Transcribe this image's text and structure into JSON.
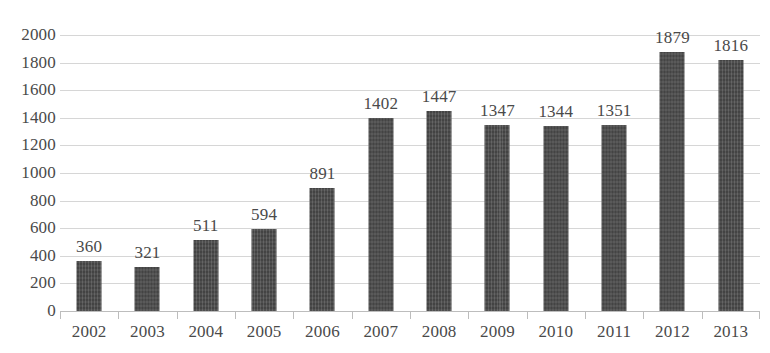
{
  "chart_data": {
    "type": "bar",
    "title": "",
    "subtitle": "",
    "xlabel": "",
    "ylabel": "",
    "categories": [
      "2002",
      "2003",
      "2004",
      "2005",
      "2006",
      "2007",
      "2008",
      "2009",
      "2010",
      "2011",
      "2012",
      "2013"
    ],
    "values": [
      360,
      321,
      511,
      594,
      891,
      1402,
      1447,
      1347,
      1344,
      1351,
      1879,
      1816
    ],
    "data_labels": [
      "360",
      "321",
      "511",
      "594",
      "891",
      "1402",
      "1447",
      "1347",
      "1344",
      "1351",
      "1879",
      "1816"
    ],
    "ylim": [
      0,
      2000
    ],
    "ytick_labels": [
      "2000",
      "1800",
      "1600",
      "1400",
      "1200",
      "1000",
      "800",
      "600",
      "400",
      "200",
      "0"
    ],
    "ytick_values": [
      2000,
      1800,
      1600,
      1400,
      1200,
      1000,
      800,
      600,
      400,
      200,
      0
    ],
    "ytick_interval": 200,
    "grid": true,
    "grid_axis": "y",
    "legend": false,
    "legend_position": "none",
    "series": [
      {
        "name": "",
        "values": [
          360,
          321,
          511,
          594,
          891,
          1402,
          1447,
          1347,
          1344,
          1351,
          1879,
          1816
        ]
      }
    ]
  },
  "style": {
    "bar_color": "#4b4b4b",
    "text_color": "#4a4a4a",
    "gridline_color": "#d6d6d6",
    "axis_color": "#bdbdbd",
    "background": "#ffffff"
  }
}
